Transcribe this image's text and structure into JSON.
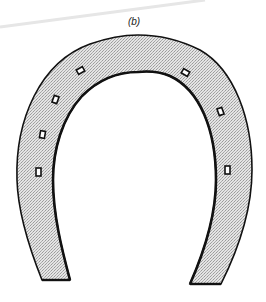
{
  "figure": {
    "label": "(b)",
    "nail_hole_count": 8,
    "colors": {
      "fill_light": "#e4e4e4",
      "fill_dark": "#9a9a9a",
      "outline": "#111111",
      "streak": "#e6e6e6",
      "background": "#ffffff"
    }
  }
}
